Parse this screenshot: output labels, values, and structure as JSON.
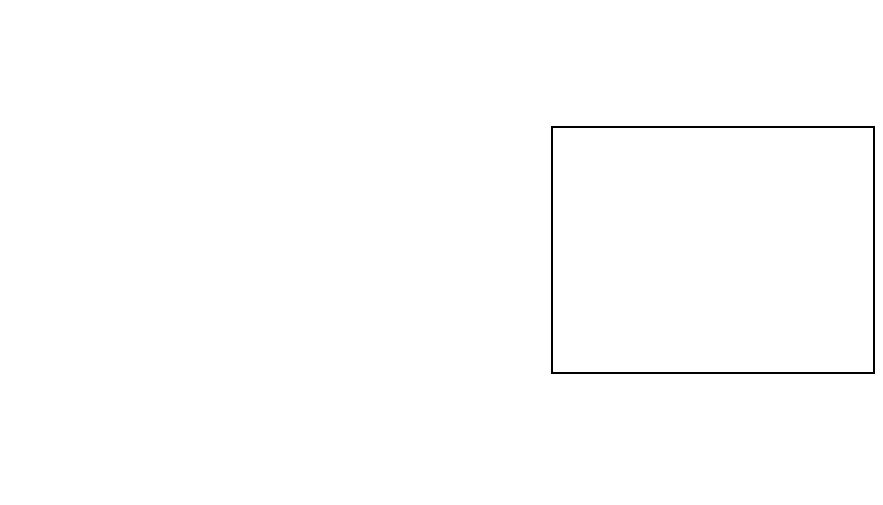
{
  "chart_data": {
    "type": "line",
    "title": "",
    "xlabel": "",
    "ylabel": "",
    "x": [
      "1997",
      "1998",
      "1999",
      "2000",
      "2001",
      "2002",
      "2003",
      "2004",
      "2005",
      "2006",
      "2007",
      "2008",
      "2009",
      "2010"
    ],
    "categories": [
      "1997",
      "1998",
      "1999",
      "2000",
      "2001",
      "2002",
      "2003",
      "2004",
      "2005",
      "2006",
      "2007",
      "2008",
      "2009",
      "2010"
    ],
    "ylim": [
      0,
      35000
    ],
    "yticks": [
      0,
      5000,
      10000,
      15000,
      20000,
      25000,
      30000,
      35000
    ],
    "ytick_labels": [
      "0",
      "5000",
      "10 000",
      "15 000",
      "20 000",
      "25 000",
      "30 000",
      "35 000"
    ],
    "grid": false,
    "legend_position": "right",
    "series": [
      {
        "name": "Public new housing",
        "color": "#585858",
        "style": "solid",
        "width": 3,
        "dash": "",
        "values": [
          5100,
          5500,
          5100,
          5400,
          5600,
          6900,
          6200,
          5800,
          6500,
          6200,
          6000,
          7800,
          11000,
          9900
        ]
      },
      {
        "name": "Private new housing",
        "color": "#000000",
        "style": "dotted",
        "width": 3,
        "dash": "7,5",
        "values": [
          7500,
          7200,
          7100,
          7300,
          7800,
          9800,
          12300,
          14400,
          15900,
          16500,
          16100,
          13000,
          6300,
          9600
        ]
      },
      {
        "name": "Infrastructure",
        "color": "#b3b3b3",
        "style": "solid",
        "width": 3,
        "dash": "",
        "values": [
          1200,
          1250,
          1200,
          1150,
          1500,
          1800,
          2000,
          2300,
          2800,
          3200,
          3700,
          3300,
          2900,
          3500
        ]
      },
      {
        "name": "Public new work exc infra",
        "color": "#6a6a6a",
        "style": "dashed",
        "width": 4,
        "dash": "16,11",
        "values": [
          4700,
          5500,
          5000,
          5300,
          5900,
          9300,
          10000,
          10500,
          10400,
          10000,
          10500,
          12700,
          14800,
          14200
        ]
      },
      {
        "name": "Private industrial",
        "color": "#000000",
        "style": "dashed",
        "width": 5,
        "dash": "18,12",
        "values": [
          4700,
          5300,
          4500,
          4400,
          4300,
          4200,
          4300,
          4600,
          5400,
          5800,
          5600,
          4900,
          3600,
          2400
        ]
      },
      {
        "name": "Private commercial",
        "color": "#000000",
        "style": "solid",
        "width": 5,
        "dash": "",
        "values": [
          13200,
          16800,
          16100,
          17000,
          17800,
          18700,
          17400,
          21600,
          23500,
          30600,
          32100,
          24300,
          12900,
          14200
        ]
      }
    ]
  }
}
